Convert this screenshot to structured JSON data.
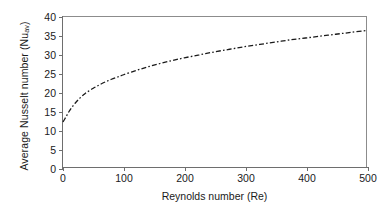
{
  "chart_data": {
    "type": "line",
    "title": "",
    "xlabel": "Reynolds number (Re)",
    "ylabel_prefix": "Average Nusselt number (Nu",
    "ylabel_subscript": "av",
    "ylabel_suffix": ")",
    "ylabel_plain": "Average Nusselt number (Nu_av)",
    "xlim": [
      0,
      500
    ],
    "ylim": [
      0,
      40
    ],
    "xticks": [
      0,
      100,
      200,
      300,
      400,
      500
    ],
    "yticks": [
      0,
      5,
      10,
      15,
      20,
      25,
      30,
      35,
      40
    ],
    "xticklabels": [
      "0",
      "100",
      "200",
      "300",
      "400",
      "500"
    ],
    "yticklabels": [
      "0",
      "5",
      "10",
      "15",
      "20",
      "25",
      "30",
      "35",
      "40"
    ],
    "grid": false,
    "legend": null,
    "line_style": "dash-dot",
    "line_color": "#1a1a1a",
    "line_width": 1.3,
    "series": [
      {
        "name": "Average Nusselt number vs Reynolds number",
        "x": [
          0,
          5,
          10,
          15,
          20,
          25,
          30,
          35,
          40,
          50,
          60,
          70,
          80,
          90,
          100,
          120,
          140,
          160,
          180,
          200,
          225,
          250,
          275,
          300,
          325,
          350,
          375,
          400,
          425,
          450,
          475,
          500
        ],
        "y": [
          12.0,
          13.4,
          14.8,
          16.0,
          17.0,
          17.9,
          18.7,
          19.4,
          20.0,
          21.0,
          21.9,
          22.7,
          23.4,
          24.0,
          24.6,
          25.7,
          26.7,
          27.6,
          28.4,
          29.1,
          29.9,
          30.7,
          31.4,
          32.1,
          32.7,
          33.3,
          33.9,
          34.4,
          34.9,
          35.4,
          35.9,
          36.4
        ]
      }
    ]
  },
  "axes": {
    "y_title_prefix": "Average Nusselt number (Nu",
    "y_title_sub": "av",
    "y_title_suffix": ")",
    "x_title": "Reynolds number (Re)"
  },
  "colors": {
    "axis": "#6e6e6e",
    "frame": "#8c8c8c",
    "text": "#1a1a1a",
    "background": "#ffffff",
    "data_line": "#1a1a1a"
  }
}
